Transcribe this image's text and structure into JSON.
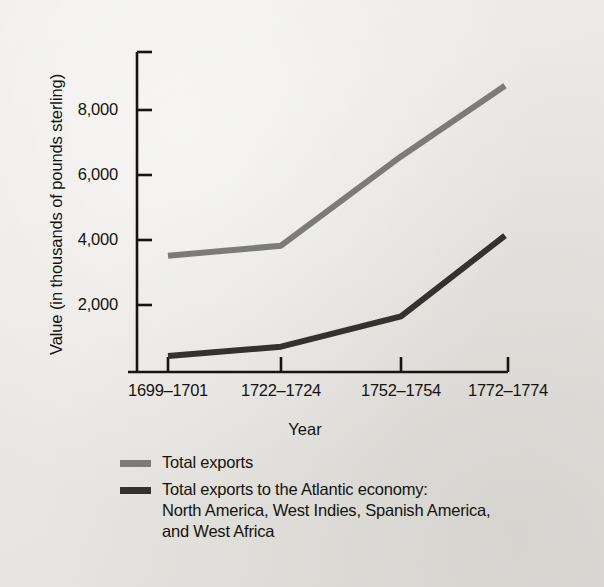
{
  "chart_data": {
    "type": "line",
    "title": "",
    "xlabel": "Year",
    "ylabel": "Value (in thousands of pounds sterling)",
    "categories": [
      "1699–1701",
      "1722–1724",
      "1752–1754",
      "1772–1774"
    ],
    "ylim": [
      0,
      9500
    ],
    "yticks": [
      2000,
      4000,
      6000,
      8000
    ],
    "ytick_labels": [
      "2,000",
      "4,000",
      "6,000",
      "8,000"
    ],
    "grid": false,
    "legend_position": "below-axes",
    "series": [
      {
        "name": "Total exports",
        "color": "#7b7b79",
        "values": [
          3450,
          3750,
          6400,
          8500
        ]
      },
      {
        "name": "Total exports to the Atlantic economy: North America, West Indies, Spanish America, and West Africa",
        "color": "#35322e",
        "values": [
          475,
          750,
          1650,
          4050
        ]
      }
    ]
  },
  "axis": {
    "y_title": "Value (in thousands of pounds sterling)",
    "x_title": "Year",
    "y_tick_labels": [
      "8,000",
      "6,000",
      "4,000",
      "2,000"
    ],
    "x_tick_labels": [
      "1699–1701",
      "1722–1724",
      "1752–1754",
      "1772–1774"
    ]
  },
  "legend": {
    "items": [
      {
        "swatch_color": "#7b7b79",
        "lines": [
          "Total exports"
        ]
      },
      {
        "swatch_color": "#35322e",
        "lines": [
          "Total exports to the Atlantic economy:",
          "North America, West Indies, Spanish America,",
          "and West Africa"
        ]
      }
    ]
  },
  "colors": {
    "background": "#e9e7e3",
    "axis": "#16140f",
    "series_total_exports": "#7b7b79",
    "series_atlantic": "#35322e"
  }
}
